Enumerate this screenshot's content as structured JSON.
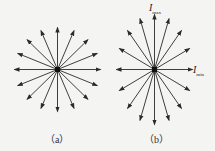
{
  "figure": {
    "panels": [
      {
        "id": "a",
        "caption": "（a）",
        "rays": 16,
        "description": "natural light: equal amplitude in all directions"
      },
      {
        "id": "b",
        "caption": "（b）",
        "rays": 16,
        "description": "partially polarized light: max along vertical, min along horizontal"
      }
    ],
    "labels": {
      "max_main": "I",
      "max_sub": "max",
      "min_main": "I",
      "min_sub": "min"
    },
    "colors": {
      "ray": "#2a2a2a",
      "background": "#f4f4f2"
    }
  }
}
